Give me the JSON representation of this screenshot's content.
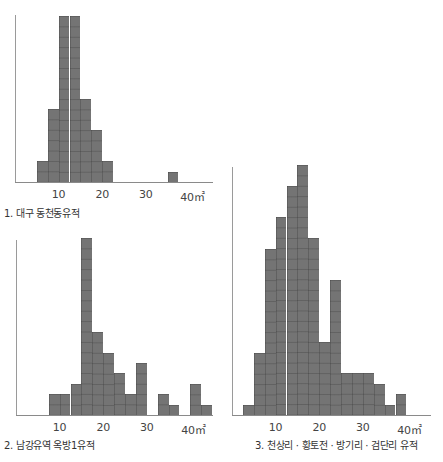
{
  "chart_data": [
    {
      "type": "bar",
      "title": "1. 대구 동천동유적",
      "xlabel": "㎡",
      "ylabel": "",
      "bin_width": 2.5,
      "xticks": [
        "10",
        "20",
        "30",
        "40㎡"
      ],
      "xlim": [
        0,
        45
      ],
      "grid": "cell grid inside bars",
      "categories": [
        "5-7.5",
        "7.5-10",
        "10-12.5",
        "12.5-15",
        "15-17.5",
        "17.5-20",
        "20-22.5",
        "35-37.5"
      ],
      "bins": [
        {
          "start": 5.0,
          "count": 2
        },
        {
          "start": 7.5,
          "count": 7
        },
        {
          "start": 10.0,
          "count": 16
        },
        {
          "start": 12.5,
          "count": 16
        },
        {
          "start": 15.0,
          "count": 8
        },
        {
          "start": 17.5,
          "count": 5
        },
        {
          "start": 20.0,
          "count": 2
        },
        {
          "start": 35.0,
          "count": 1
        }
      ],
      "values": [
        2,
        7,
        16,
        16,
        8,
        5,
        2,
        1
      ]
    },
    {
      "type": "bar",
      "title": "2. 남강유역 옥방1유적",
      "xlabel": "㎡",
      "ylabel": "",
      "bin_width": 2.5,
      "xticks": [
        "10",
        "20",
        "30",
        "40㎡"
      ],
      "xlim": [
        0,
        45
      ],
      "grid": "cell grid inside bars",
      "categories": [
        "7.5-10",
        "10-12.5",
        "12.5-15",
        "15-17.5",
        "17.5-20",
        "20-22.5",
        "22.5-25",
        "25-27.5",
        "27.5-30",
        "32.5-35",
        "35-37.5",
        "40-42.5",
        "42.5-45"
      ],
      "bins": [
        {
          "start": 7.5,
          "count": 2
        },
        {
          "start": 10.0,
          "count": 2
        },
        {
          "start": 12.5,
          "count": 3
        },
        {
          "start": 15.0,
          "count": 17
        },
        {
          "start": 17.5,
          "count": 8
        },
        {
          "start": 20.0,
          "count": 6
        },
        {
          "start": 22.5,
          "count": 4
        },
        {
          "start": 25.0,
          "count": 2
        },
        {
          "start": 27.5,
          "count": 5
        },
        {
          "start": 32.5,
          "count": 2
        },
        {
          "start": 35.0,
          "count": 1
        },
        {
          "start": 40.0,
          "count": 3
        },
        {
          "start": 42.5,
          "count": 1
        }
      ],
      "values": [
        2,
        2,
        3,
        17,
        8,
        6,
        4,
        2,
        5,
        2,
        1,
        3,
        1
      ]
    },
    {
      "type": "bar",
      "title": "3. 천상리 · 황토전 · 방기리 · 검단리 유적",
      "xlabel": "㎡",
      "ylabel": "",
      "bin_width": 2.5,
      "xticks": [
        "10",
        "20",
        "30",
        "40㎡"
      ],
      "xlim": [
        0,
        45
      ],
      "grid": "cell grid inside bars",
      "categories": [
        "2.5-5",
        "5-7.5",
        "7.5-10",
        "10-12.5",
        "12.5-15",
        "15-17.5",
        "17.5-20",
        "20-22.5",
        "22.5-25",
        "25-27.5",
        "27.5-30",
        "30-32.5",
        "32.5-35",
        "35-37.5",
        "37.5-40"
      ],
      "bins": [
        {
          "start": 2.5,
          "count": 1
        },
        {
          "start": 5.0,
          "count": 6
        },
        {
          "start": 7.5,
          "count": 16
        },
        {
          "start": 10.0,
          "count": 19
        },
        {
          "start": 12.5,
          "count": 22
        },
        {
          "start": 15.0,
          "count": 24
        },
        {
          "start": 17.5,
          "count": 17
        },
        {
          "start": 20.0,
          "count": 7
        },
        {
          "start": 22.5,
          "count": 13
        },
        {
          "start": 25.0,
          "count": 4
        },
        {
          "start": 27.5,
          "count": 4
        },
        {
          "start": 30.0,
          "count": 4
        },
        {
          "start": 32.5,
          "count": 3
        },
        {
          "start": 35.0,
          "count": 1
        },
        {
          "start": 37.5,
          "count": 2
        }
      ],
      "values": [
        1,
        6,
        16,
        19,
        22,
        24,
        17,
        7,
        13,
        4,
        4,
        4,
        3,
        1,
        2
      ]
    }
  ],
  "colors": {
    "bar_fill": "#747474",
    "bar_grid": "#5f5f5f",
    "axis": "#9a9a9a",
    "text": "#333333"
  }
}
